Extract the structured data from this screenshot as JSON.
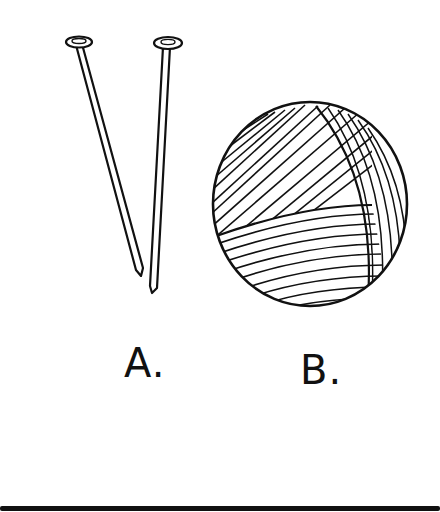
{
  "figure": {
    "items": [
      {
        "id": "A",
        "label": "A.",
        "depicts": "knitting-needles"
      },
      {
        "id": "B",
        "label": "B.",
        "depicts": "ball-of-yarn"
      }
    ]
  },
  "colors": {
    "ink": "#111111",
    "background": "#ffffff"
  }
}
